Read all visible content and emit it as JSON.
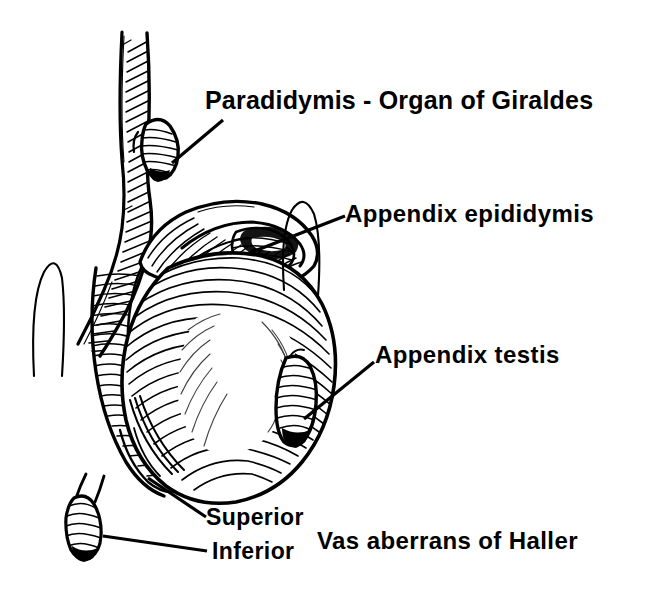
{
  "figure": {
    "style": "black-and-white line engraving",
    "background_color": "#ffffff",
    "ink_color": "#000000"
  },
  "labels": {
    "paradidymis": "Paradidymis - Organ of Giraldes",
    "appendix_epididymis": "Appendix epididymis",
    "appendix_testis": "Appendix testis",
    "superior": "Superior",
    "inferior": "Inferior",
    "vas_aberrans": "Vas aberrans of Haller"
  },
  "structures": [
    {
      "name": "spermatic-cord",
      "label": null
    },
    {
      "name": "paradidymis-nodule",
      "label": "Paradidymis - Organ of Giraldes"
    },
    {
      "name": "epididymis-head",
      "label": null
    },
    {
      "name": "appendix-epididymis-nodule",
      "label": "Appendix epididymis"
    },
    {
      "name": "testis-body",
      "label": null
    },
    {
      "name": "appendix-testis-nodule",
      "label": "Appendix testis"
    },
    {
      "name": "vas-aberrans-superior",
      "label": "Superior"
    },
    {
      "name": "vas-aberrans-inferior",
      "label": "Inferior"
    }
  ],
  "leaders": [
    {
      "name": "leader-paradidymis",
      "from": [
        172,
        163
      ],
      "to": [
        223,
        120
      ]
    },
    {
      "name": "leader-appendix-epididymis",
      "from": [
        252,
        252
      ],
      "to": [
        345,
        216
      ]
    },
    {
      "name": "leader-appendix-testis",
      "from": [
        304,
        419
      ],
      "to": [
        374,
        362
      ]
    },
    {
      "name": "leader-superior",
      "from": [
        148,
        478
      ],
      "to": [
        206,
        517
      ]
    },
    {
      "name": "leader-inferior",
      "from": [
        103,
        536
      ],
      "to": [
        207,
        551
      ]
    }
  ]
}
